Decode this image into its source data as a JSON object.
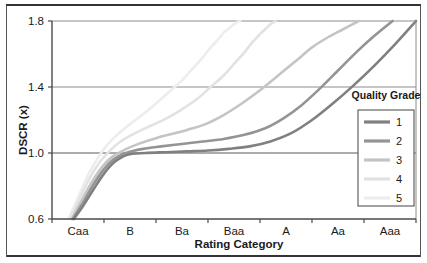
{
  "chart_data": {
    "type": "line",
    "title": "",
    "xlabel": "Rating Category",
    "ylabel": "DSCR (x)",
    "categories": [
      "Caa",
      "B",
      "Ba",
      "Baa",
      "A",
      "Aa",
      "Aaa"
    ],
    "x_tick_labels": [
      "Caa",
      "B",
      "Ba",
      "Baa",
      "A",
      "Aa",
      "Aaa"
    ],
    "y_tick_labels": [
      "0.6",
      "1.0",
      "1.4",
      "1.8"
    ],
    "ylim": [
      0.6,
      1.8
    ],
    "xlim": [
      0,
      7
    ],
    "grid": "horizontal",
    "legend_position": "right",
    "legend_title": "Quality Grade",
    "series": [
      {
        "name": "1",
        "color": "#808080",
        "x": [
          0.42,
          0.6,
          0.8,
          1.0,
          1.2,
          1.45,
          1.8,
          2.2,
          2.6,
          3.0,
          3.4,
          3.8,
          4.2,
          4.6,
          5.0,
          5.4,
          5.8,
          6.2,
          6.6,
          7.0
        ],
        "y": [
          0.6,
          0.68,
          0.78,
          0.875,
          0.945,
          0.99,
          1.0,
          1.005,
          1.01,
          1.015,
          1.025,
          1.04,
          1.07,
          1.12,
          1.2,
          1.3,
          1.41,
          1.53,
          1.66,
          1.8
        ]
      },
      {
        "name": "2",
        "color": "#949494",
        "x": [
          0.4,
          0.58,
          0.78,
          0.98,
          1.18,
          1.42,
          1.75,
          2.1,
          2.5,
          2.9,
          3.3,
          3.7,
          4.1,
          4.45,
          4.8,
          5.15,
          5.5,
          5.85,
          6.2,
          6.55
        ],
        "y": [
          0.6,
          0.69,
          0.8,
          0.895,
          0.96,
          1.0,
          1.025,
          1.04,
          1.055,
          1.07,
          1.085,
          1.11,
          1.15,
          1.21,
          1.29,
          1.39,
          1.5,
          1.61,
          1.71,
          1.8
        ]
      },
      {
        "name": "3",
        "color": "#c4c4c4",
        "x": [
          0.38,
          0.55,
          0.75,
          0.95,
          1.15,
          1.4,
          1.7,
          2.0,
          2.3,
          2.6,
          2.95,
          3.3,
          3.65,
          4.0,
          4.35,
          4.7,
          5.0,
          5.3,
          5.6,
          5.9
        ],
        "y": [
          0.6,
          0.7,
          0.815,
          0.91,
          0.975,
          1.02,
          1.06,
          1.09,
          1.115,
          1.14,
          1.175,
          1.23,
          1.3,
          1.38,
          1.47,
          1.56,
          1.64,
          1.7,
          1.75,
          1.8
        ]
      },
      {
        "name": "4",
        "color": "#e2e2e2",
        "x": [
          0.35,
          0.52,
          0.72,
          0.92,
          1.1,
          1.32,
          1.6,
          1.9,
          2.2,
          2.5,
          2.8,
          3.05,
          3.3,
          3.5,
          3.7,
          3.85,
          4.0,
          4.1,
          4.2,
          4.3
        ],
        "y": [
          0.6,
          0.715,
          0.845,
          0.945,
          1.01,
          1.07,
          1.12,
          1.165,
          1.21,
          1.265,
          1.33,
          1.4,
          1.47,
          1.54,
          1.61,
          1.67,
          1.72,
          1.75,
          1.78,
          1.8
        ]
      },
      {
        "name": "5",
        "color": "#ededed",
        "x": [
          0.32,
          0.5,
          0.7,
          0.88,
          1.05,
          1.25,
          1.5,
          1.75,
          2.0,
          2.25,
          2.5,
          2.7,
          2.9,
          3.05,
          3.2,
          3.3,
          3.4,
          3.48,
          3.55,
          3.62
        ],
        "y": [
          0.6,
          0.73,
          0.87,
          0.97,
          1.045,
          1.11,
          1.175,
          1.235,
          1.3,
          1.37,
          1.44,
          1.51,
          1.58,
          1.64,
          1.69,
          1.73,
          1.755,
          1.775,
          1.79,
          1.8
        ]
      }
    ]
  },
  "legend": {
    "title": "Quality Grade",
    "entries": [
      {
        "label": "1",
        "color": "#808080"
      },
      {
        "label": "2",
        "color": "#949494"
      },
      {
        "label": "3",
        "color": "#c4c4c4"
      },
      {
        "label": "4",
        "color": "#e2e2e2"
      },
      {
        "label": "5",
        "color": "#ededed"
      }
    ]
  }
}
